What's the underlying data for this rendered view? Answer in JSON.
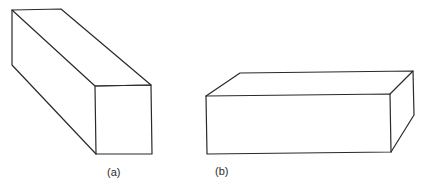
{
  "figure": {
    "panels": [
      {
        "id": "a",
        "label": "(a)",
        "description": "Elongated rectangular box viewed end-on with square front face"
      },
      {
        "id": "b",
        "label": "(b)",
        "description": "Flat rectangular box viewed with long front face"
      }
    ],
    "colors": {
      "line": "#2a2a2a",
      "background": "#ffffff"
    }
  }
}
